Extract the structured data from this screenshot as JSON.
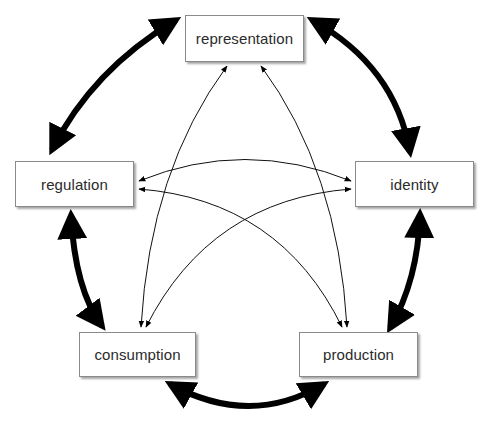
{
  "diagram": {
    "type": "cycle-diagram",
    "nodes": [
      {
        "id": "representation",
        "label": "representation"
      },
      {
        "id": "identity",
        "label": "identity"
      },
      {
        "id": "production",
        "label": "production"
      },
      {
        "id": "consumption",
        "label": "consumption"
      },
      {
        "id": "regulation",
        "label": "regulation"
      }
    ],
    "edges": [
      {
        "from": "representation",
        "to": "identity",
        "style": "thick",
        "direction": "both"
      },
      {
        "from": "identity",
        "to": "production",
        "style": "thick",
        "direction": "both"
      },
      {
        "from": "production",
        "to": "consumption",
        "style": "thick",
        "direction": "both"
      },
      {
        "from": "consumption",
        "to": "regulation",
        "style": "thick",
        "direction": "both"
      },
      {
        "from": "regulation",
        "to": "representation",
        "style": "thick",
        "direction": "both"
      },
      {
        "from": "representation",
        "to": "consumption",
        "style": "thin",
        "direction": "both"
      },
      {
        "from": "representation",
        "to": "production",
        "style": "thin",
        "direction": "both"
      },
      {
        "from": "regulation",
        "to": "identity",
        "style": "thin",
        "direction": "both"
      },
      {
        "from": "regulation",
        "to": "production",
        "style": "thin",
        "direction": "both"
      },
      {
        "from": "identity",
        "to": "consumption",
        "style": "thin",
        "direction": "both"
      }
    ],
    "colors": {
      "arrow": "#000000",
      "box_border": "#8a8a8a",
      "text": "#2b2b2b",
      "background": "#ffffff"
    }
  }
}
